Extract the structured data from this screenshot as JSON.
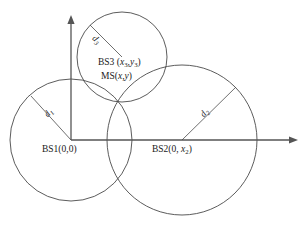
{
  "figure": {
    "type": "trilateration-diagram",
    "background_color": "#ffffff",
    "line_color": "#4a4a4a",
    "text_color": "#1a1a1a"
  },
  "axes": {
    "y_axis": {
      "name": "y-axis",
      "from": [
        71,
        140
      ],
      "to": [
        71,
        17
      ],
      "arrow": "up"
    },
    "x_axis": {
      "name": "x-axis",
      "from": [
        71,
        140
      ],
      "to": [
        297,
        140
      ],
      "arrow": "right"
    },
    "origin": [
      71,
      140
    ]
  },
  "circles": [
    {
      "id": "bs1-circle",
      "center": [
        71,
        140
      ],
      "radius": 61,
      "label": "BS1(0,0)"
    },
    {
      "id": "bs2-circle",
      "center": [
        182,
        140
      ],
      "radius": 75,
      "label": "BS2(0, x2)"
    },
    {
      "id": "bs3-circle",
      "center": [
        122,
        57
      ],
      "radius": 45,
      "label": "BS3 (x3,y3)"
    }
  ],
  "labels": {
    "bs1": {
      "prefix": "BS1(0,0)"
    },
    "bs2": {
      "prefix": "BS2(0, ",
      "var": "x",
      "sub": "2",
      "suffix": ")"
    },
    "bs3": {
      "prefix": "BS3 (",
      "var1": "x",
      "sub1": "3",
      "comma": ",",
      "var2": "y",
      "sub2": "3",
      "suffix": ")"
    },
    "ms": {
      "prefix": "MS(",
      "var1": "x",
      "comma": ",",
      "var2": "y",
      "suffix": ")"
    }
  },
  "radii_labels": [
    {
      "id": "d1-label",
      "text": "d",
      "sub": "1",
      "belongs_to": "bs1-circle",
      "line_from": [
        71,
        140
      ],
      "line_to": [
        31,
        96
      ]
    },
    {
      "id": "d2-label",
      "text": "d",
      "sub": "2",
      "belongs_to": "bs2-circle",
      "line_from": [
        182,
        140
      ],
      "line_to": [
        236,
        87
      ]
    },
    {
      "id": "d3-label",
      "text": "d",
      "sub": "3",
      "belongs_to": "bs3-circle",
      "line_from": [
        122,
        57
      ],
      "line_to": [
        90,
        25
      ]
    }
  ],
  "intersection_point": {
    "name": "mobile-station-position",
    "coords": [
      117,
      100
    ]
  }
}
